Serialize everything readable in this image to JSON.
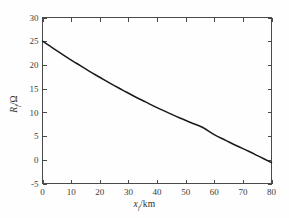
{
  "chart_data": {
    "type": "line",
    "title": "",
    "subtitle": "",
    "xlabel": "x_f/km",
    "ylabel": "R_f/Ω",
    "xlabel_symbol": "x",
    "xlabel_subscript": "f",
    "xlabel_unit": "/km",
    "ylabel_symbol": "R",
    "ylabel_subscript": "f",
    "ylabel_unit": "/Ω",
    "xlim": [
      0,
      80
    ],
    "ylim": [
      -5,
      30
    ],
    "xticks": [
      0,
      10,
      20,
      30,
      40,
      50,
      60,
      70,
      80
    ],
    "yticks": [
      -5,
      0,
      5,
      10,
      15,
      20,
      25,
      30
    ],
    "xticklabels": [
      "0",
      "10",
      "20",
      "30",
      "40",
      "50",
      "60",
      "70",
      "80"
    ],
    "yticklabels": [
      "-5",
      "0",
      "5",
      "10",
      "15",
      "20",
      "25",
      "30"
    ],
    "grid": false,
    "legend": null,
    "box": true,
    "tick_direction": "in",
    "line_color": "#1a1a1a",
    "axis_color": "#4a4a4a",
    "background_color": "#fefefe",
    "series": [
      {
        "name": "Rf",
        "x": [
          0,
          4,
          8,
          12,
          16,
          20,
          24,
          28,
          32,
          36,
          40,
          44,
          48,
          52,
          56,
          60,
          64,
          68,
          72,
          76,
          80
        ],
        "values": [
          25.0,
          23.4,
          21.8,
          20.3,
          18.8,
          17.4,
          16.0,
          14.7,
          13.4,
          12.2,
          11.0,
          9.9,
          8.8,
          7.8,
          6.8,
          5.3,
          4.1,
          2.9,
          1.8,
          0.6,
          -0.6
        ]
      }
    ]
  }
}
